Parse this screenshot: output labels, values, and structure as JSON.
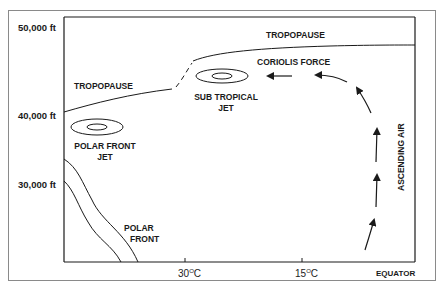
{
  "diagram": {
    "y_axis": {
      "ticks": [
        {
          "label": "50,000 ft"
        },
        {
          "label": "40,000 ft"
        },
        {
          "label": "30,000 ft"
        }
      ]
    },
    "x_axis": {
      "ticks": [
        {
          "label": "30",
          "unit": "C",
          "degree": "O"
        },
        {
          "label": "15",
          "unit": "C",
          "degree": "O"
        }
      ],
      "end_label": "EQUATOR"
    },
    "labels": {
      "tropopause_high": "TROPOPAUSE",
      "tropopause_low": "TROPOPAUSE",
      "coriolis_force": "CORIOLIS FORCE",
      "sub_tropical_jet_line1": "SUB TROPICAL",
      "sub_tropical_jet_line2": "JET",
      "polar_front_jet_line1": "POLAR FRONT",
      "polar_front_jet_line2": "JET",
      "polar_front_line1": "POLAR",
      "polar_front_line2": "FRONT",
      "ascending_air": "ASCENDING AIR"
    },
    "colors": {
      "line": "#1a1a1a",
      "frame": "#8a8a8a",
      "background": "#ffffff"
    }
  }
}
